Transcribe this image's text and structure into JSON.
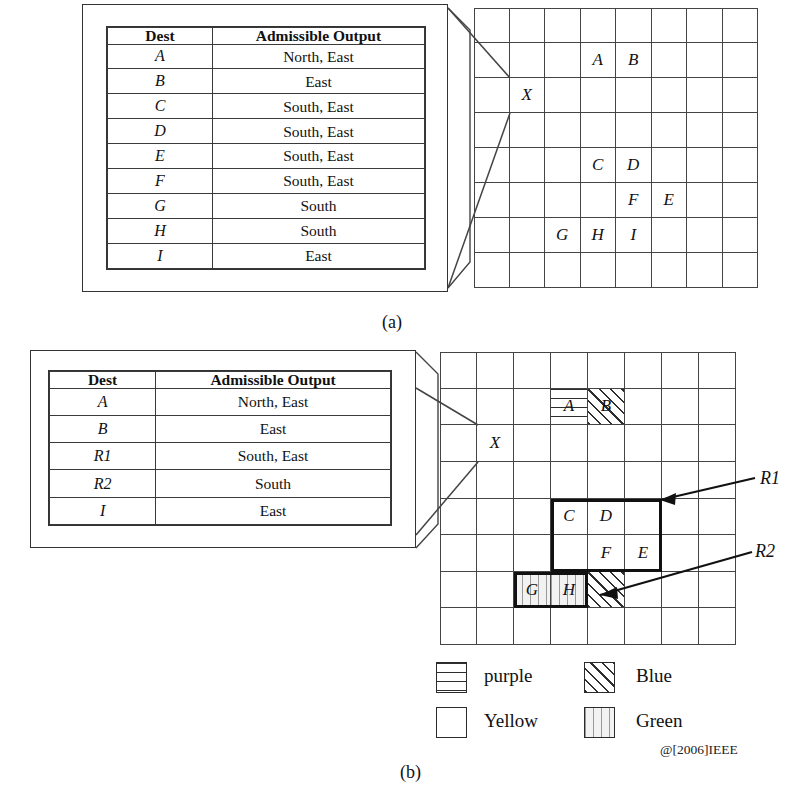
{
  "figure": {
    "panel_a_label": "(a)",
    "panel_b_label": "(b)",
    "copyright": "@[2006]IEEE"
  },
  "table_a": {
    "headers": [
      "Dest",
      "Admissible Output"
    ],
    "rows": [
      {
        "dest": "A",
        "output": "North, East"
      },
      {
        "dest": "B",
        "output": "East"
      },
      {
        "dest": "C",
        "output": "South, East"
      },
      {
        "dest": "D",
        "output": "South, East"
      },
      {
        "dest": "E",
        "output": "South, East"
      },
      {
        "dest": "F",
        "output": "South, East"
      },
      {
        "dest": "G",
        "output": "South"
      },
      {
        "dest": "H",
        "output": "South"
      },
      {
        "dest": "I",
        "output": "East"
      }
    ]
  },
  "table_b": {
    "headers": [
      "Dest",
      "Admissible Output"
    ],
    "rows": [
      {
        "dest": "A",
        "output": "North, East"
      },
      {
        "dest": "B",
        "output": "East"
      },
      {
        "dest": "R1",
        "output": "South, East"
      },
      {
        "dest": "R2",
        "output": "South"
      },
      {
        "dest": "I",
        "output": "East"
      }
    ]
  },
  "grid_a": {
    "cols": 8,
    "rows": 8,
    "cells": [
      {
        "row": 1,
        "col": 3,
        "label": "A",
        "fill": "yellow"
      },
      {
        "row": 1,
        "col": 4,
        "label": "B",
        "fill": "yellow"
      },
      {
        "row": 2,
        "col": 1,
        "label": "X",
        "fill": "yellow"
      },
      {
        "row": 4,
        "col": 3,
        "label": "C",
        "fill": "yellow"
      },
      {
        "row": 4,
        "col": 4,
        "label": "D",
        "fill": "yellow"
      },
      {
        "row": 5,
        "col": 4,
        "label": "F",
        "fill": "yellow"
      },
      {
        "row": 5,
        "col": 5,
        "label": "E",
        "fill": "yellow"
      },
      {
        "row": 6,
        "col": 2,
        "label": "G",
        "fill": "yellow"
      },
      {
        "row": 6,
        "col": 3,
        "label": "H",
        "fill": "yellow"
      },
      {
        "row": 6,
        "col": 4,
        "label": "I",
        "fill": "yellow"
      }
    ]
  },
  "grid_b": {
    "cols": 8,
    "rows": 8,
    "cells": [
      {
        "row": 1,
        "col": 3,
        "label": "A",
        "fill": "purple"
      },
      {
        "row": 1,
        "col": 4,
        "label": "B",
        "fill": "blue"
      },
      {
        "row": 2,
        "col": 1,
        "label": "X",
        "fill": "yellow"
      },
      {
        "row": 4,
        "col": 3,
        "label": "C",
        "fill": "yellow"
      },
      {
        "row": 4,
        "col": 4,
        "label": "D",
        "fill": "yellow"
      },
      {
        "row": 5,
        "col": 4,
        "label": "F",
        "fill": "yellow"
      },
      {
        "row": 5,
        "col": 5,
        "label": "E",
        "fill": "yellow"
      },
      {
        "row": 6,
        "col": 2,
        "label": "G",
        "fill": "green"
      },
      {
        "row": 6,
        "col": 3,
        "label": "H",
        "fill": "green"
      },
      {
        "row": 6,
        "col": 4,
        "label": "",
        "fill": "blue"
      }
    ],
    "regions": [
      {
        "name": "R1",
        "label": "R1",
        "col_start": 3,
        "col_end": 5,
        "row_start": 4,
        "row_end": 5
      },
      {
        "name": "R2",
        "label": "R2",
        "col_start": 2,
        "col_end": 3,
        "row_start": 6,
        "row_end": 6
      }
    ]
  },
  "legend": {
    "items": [
      {
        "pattern": "purple",
        "label": "purple"
      },
      {
        "pattern": "blue",
        "label": "Blue"
      },
      {
        "pattern": "yellow",
        "label": "Yellow"
      },
      {
        "pattern": "green",
        "label": "Green"
      }
    ]
  }
}
